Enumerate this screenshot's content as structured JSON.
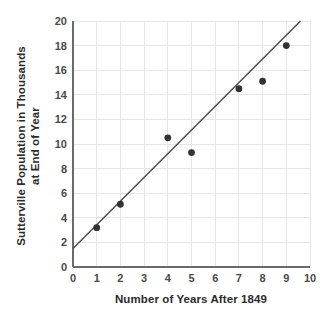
{
  "chart_data": {
    "type": "scatter",
    "title": "",
    "xlabel": "Number of Years After 1849",
    "ylabel_line1": "Sutterville Population in Thousands",
    "ylabel_line2": "at End of Year",
    "xlim": [
      0,
      10
    ],
    "ylim": [
      0,
      20
    ],
    "xticks": [
      0,
      1,
      2,
      3,
      4,
      5,
      6,
      7,
      8,
      9,
      10
    ],
    "xtick_labels": [
      "0",
      "1",
      "2",
      "3",
      "4",
      "5",
      "6",
      "7",
      "8",
      "9",
      "10"
    ],
    "yticks": [
      0,
      2,
      4,
      6,
      8,
      10,
      12,
      14,
      16,
      18,
      20
    ],
    "ytick_labels": [
      "0",
      "2",
      "4",
      "6",
      "8",
      "10",
      "12",
      "14",
      "16",
      "18",
      "20"
    ],
    "grid": true,
    "legend": false,
    "x": [
      1,
      2,
      4,
      5,
      7,
      8,
      9
    ],
    "y": [
      3.2,
      5.1,
      10.5,
      9.3,
      14.5,
      15.1,
      18.0
    ],
    "points": [
      {
        "x": 1,
        "y": 3.2
      },
      {
        "x": 2,
        "y": 5.1
      },
      {
        "x": 4,
        "y": 10.5
      },
      {
        "x": 5,
        "y": 9.3
      },
      {
        "x": 7,
        "y": 14.5
      },
      {
        "x": 8,
        "y": 15.1
      },
      {
        "x": 9,
        "y": 18.0
      }
    ],
    "trend_line": {
      "x_start": 0,
      "y_start": 1.5,
      "x_end": 9.6,
      "y_end": 20.0,
      "slope": 1.927,
      "intercept": 1.5
    },
    "colors": {
      "point": "#333333",
      "trend": "#4a4a4a",
      "grid": "#e6e6e6",
      "axis": "#6a6a6a",
      "text": "#2b2b2b",
      "background": "#ffffff"
    }
  }
}
